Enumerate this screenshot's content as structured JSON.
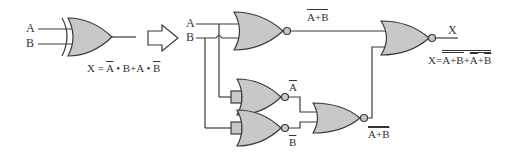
{
  "left": {
    "input_a": "A",
    "input_b": "B",
    "expression": {
      "prefix": "X = ",
      "t1_bar": "A",
      "dot1": " • ",
      "t1_b": "B",
      "plus": "+",
      "t2_a": "A",
      "dot2": " • ",
      "t2_bar": "B"
    }
  },
  "arrow": "right-arrow",
  "right": {
    "input_a": "A",
    "input_b": "B",
    "nor1_out": "A+B",
    "not_a": "A",
    "not_b": "B",
    "nor4_out": "A+B",
    "output": "X",
    "final_expr": {
      "prefix": "X=",
      "term1": "A+B",
      "plus": "+",
      "term2_a": "A",
      "term2_plus": "+",
      "term2_b": "B"
    }
  },
  "colors": {
    "gate_fill": "#c8c8c8",
    "stroke": "#3a3a3a"
  }
}
